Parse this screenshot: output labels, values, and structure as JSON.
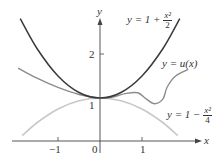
{
  "chart_data": {
    "type": "line",
    "title": "",
    "xlabel": "x",
    "ylabel": "y",
    "xlim": [
      -2.4,
      2.9
    ],
    "ylim": [
      0,
      3.1
    ],
    "x_ticks": [
      "-1",
      "0",
      "1"
    ],
    "y_ticks": [
      "1",
      "2"
    ],
    "grid": false,
    "series": [
      {
        "name": "y = 1 + x^2/2",
        "label_parts": {
          "pre": "y = 1 + ",
          "num": "x²",
          "den": "2"
        },
        "color": "#3a3a3a",
        "x": [
          -1.9,
          -1.5,
          -1,
          -0.5,
          0,
          0.5,
          1,
          1.5,
          1.9
        ],
        "values": [
          2.805,
          2.125,
          1.5,
          1.125,
          1,
          1.125,
          1.5,
          2.125,
          2.805
        ]
      },
      {
        "name": "y = u(x)",
        "label": "y = u(x)",
        "color": "#8c8c8c",
        "x": [
          -1.95,
          -1.5,
          -1,
          -0.5,
          0,
          0.3,
          0.6,
          0.9,
          1.1,
          1.3,
          1.5,
          1.6,
          1.8,
          2.1
        ],
        "values": [
          1.68,
          1.45,
          1.24,
          1.08,
          1.0,
          1.02,
          1.1,
          1.12,
          0.98,
          0.87,
          0.98,
          1.25,
          1.5,
          1.65
        ]
      },
      {
        "name": "y = 1 - x^2/4",
        "label_parts": {
          "pre": "y = 1 − ",
          "num": "x²",
          "den": "4"
        },
        "color": "#c8c8c8",
        "x": [
          -1.85,
          -1.5,
          -1,
          -0.5,
          0,
          0.5,
          1,
          1.5,
          1.85
        ],
        "values": [
          0.144,
          0.4375,
          0.75,
          0.9375,
          1,
          0.9375,
          0.75,
          0.4375,
          0.144
        ]
      }
    ]
  },
  "labels": {
    "x_axis": "x",
    "y_axis": "y",
    "tick_neg1": "−1",
    "tick_0": "0",
    "tick_1x": "1",
    "tick_1y": "1",
    "tick_2y": "2",
    "upper_pre": "y = 1 + ",
    "upper_num": "x²",
    "upper_den": "2",
    "u_label": "y = u(x)",
    "lower_pre": "y = 1 − ",
    "lower_num": "x²",
    "lower_den": "4"
  }
}
